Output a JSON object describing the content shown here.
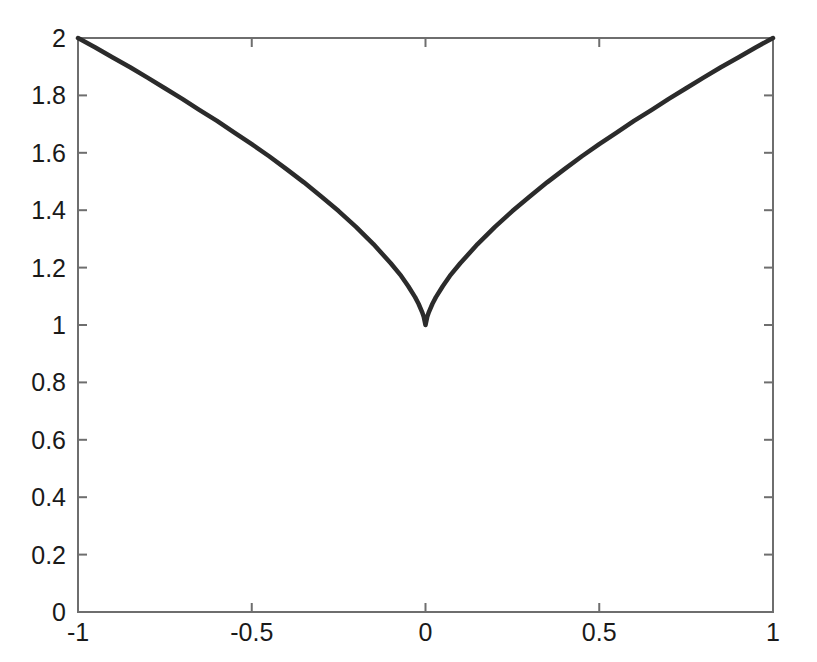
{
  "chart_data": {
    "type": "line",
    "title": "",
    "subtitle": "",
    "xlabel": "",
    "ylabel": "",
    "xlim": [
      -1,
      1
    ],
    "ylim": [
      0,
      2
    ],
    "grid": false,
    "legend": null,
    "legend_position": "none",
    "xticks": [
      -1,
      -0.5,
      0,
      0.5,
      1
    ],
    "xtick_labels": [
      "-1",
      "-0.5",
      "0",
      "0.5",
      "1"
    ],
    "yticks": [
      0,
      0.2,
      0.4,
      0.6,
      0.8,
      1,
      1.2,
      1.4,
      1.6,
      1.8,
      2
    ],
    "ytick_labels": [
      "0",
      "0.2",
      "0.4",
      "0.6",
      "0.8",
      "1",
      "1.2",
      "1.4",
      "1.6",
      "1.8",
      "2"
    ],
    "series": [
      {
        "name": "f(x) = 1 + |x|^(2/3)",
        "color": "#2b2b2b",
        "line_width": 4.5,
        "x": [
          -1,
          -0.95,
          -0.9,
          -0.85,
          -0.8,
          -0.75,
          -0.7,
          -0.65,
          -0.6,
          -0.55,
          -0.5,
          -0.45,
          -0.4,
          -0.35,
          -0.3,
          -0.25,
          -0.2,
          -0.15,
          -0.1,
          -0.07,
          -0.05,
          -0.03,
          -0.02,
          -0.01,
          -0.005,
          0,
          0.005,
          0.01,
          0.02,
          0.03,
          0.05,
          0.07,
          0.1,
          0.15,
          0.2,
          0.25,
          0.3,
          0.35,
          0.4,
          0.45,
          0.5,
          0.55,
          0.6,
          0.65,
          0.7,
          0.75,
          0.8,
          0.85,
          0.9,
          0.95,
          1
        ],
        "y": [
          2,
          1.967,
          1.932,
          1.898,
          1.862,
          1.825,
          1.788,
          1.749,
          1.711,
          1.67,
          1.63,
          1.588,
          1.543,
          1.497,
          1.448,
          1.397,
          1.342,
          1.282,
          1.215,
          1.171,
          1.136,
          1.097,
          1.074,
          1.046,
          1.029,
          1,
          1.029,
          1.046,
          1.074,
          1.097,
          1.136,
          1.171,
          1.215,
          1.282,
          1.342,
          1.397,
          1.448,
          1.497,
          1.543,
          1.588,
          1.63,
          1.67,
          1.711,
          1.749,
          1.788,
          1.825,
          1.862,
          1.898,
          1.932,
          1.967,
          2
        ]
      }
    ],
    "colors": {
      "line": "#2b2b2b",
      "axis": "#6e6e6e",
      "text": "#1a1a1a",
      "background": "#ffffff"
    }
  },
  "axes": {
    "x_tick_labels": [
      "-1",
      "-0.5",
      "0",
      "0.5",
      "1"
    ],
    "y_tick_labels": [
      "2",
      "1.8",
      "1.6",
      "1.4",
      "1.2",
      "1",
      "0.8",
      "0.6",
      "0.4",
      "0.2",
      "0"
    ]
  }
}
